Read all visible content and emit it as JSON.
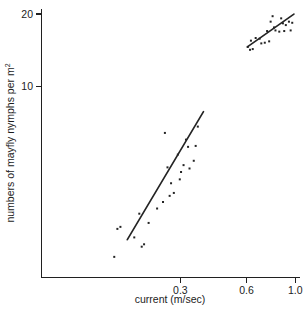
{
  "chart_data": {
    "type": "scatter",
    "title": "",
    "xlabel": "current (m/sec)",
    "ylabel": "numbers of mayfly nymphs per m²",
    "ylabel_base": "numbers of mayfly nymphs per m",
    "ylabel_exponent": "2",
    "x_scale": "log",
    "y_scale": "log",
    "grid": false,
    "legend": "none",
    "xticks": [
      "0.3",
      "0.6",
      "1.0"
    ],
    "xtick_values": [
      0.3,
      0.6,
      1.0
    ],
    "yticks": [
      "10",
      "20"
    ],
    "ytick_values": [
      10,
      20
    ],
    "xlim": [
      0.07,
      1.05
    ],
    "ylim": [
      1.6,
      21
    ],
    "series": [
      {
        "name": "low-current group",
        "points": [
          [
            0.15,
            1.95
          ],
          [
            0.155,
            2.55
          ],
          [
            0.16,
            2.6
          ],
          [
            0.185,
            2.35
          ],
          [
            0.195,
            2.95
          ],
          [
            0.2,
            2.15
          ],
          [
            0.205,
            2.2
          ],
          [
            0.215,
            2.7
          ],
          [
            0.235,
            3.1
          ],
          [
            0.25,
            3.3
          ],
          [
            0.255,
            6.4
          ],
          [
            0.262,
            4.6
          ],
          [
            0.268,
            3.5
          ],
          [
            0.272,
            3.95
          ],
          [
            0.28,
            3.6
          ],
          [
            0.292,
            5.2
          ],
          [
            0.298,
            4.1
          ],
          [
            0.302,
            4.4
          ],
          [
            0.31,
            4.7
          ],
          [
            0.318,
            6.0
          ],
          [
            0.325,
            5.6
          ],
          [
            0.33,
            4.55
          ],
          [
            0.345,
            4.9
          ],
          [
            0.352,
            5.65
          ],
          [
            0.36,
            6.8
          ]
        ],
        "fit_line": {
          "x_start": 0.172,
          "y_start": 2.3,
          "x_end": 0.382,
          "y_end": 7.85
        }
      },
      {
        "name": "high-current group",
        "points": [
          [
            0.608,
            14.6
          ],
          [
            0.622,
            14.2
          ],
          [
            0.628,
            15.5
          ],
          [
            0.64,
            14.3
          ],
          [
            0.66,
            15.9
          ],
          [
            0.688,
            15.8
          ],
          [
            0.7,
            15.1
          ],
          [
            0.726,
            15.2
          ],
          [
            0.744,
            17.0
          ],
          [
            0.76,
            15.4
          ],
          [
            0.772,
            18.6
          ],
          [
            0.788,
            19.6
          ],
          [
            0.8,
            17.6
          ],
          [
            0.812,
            17.1
          ],
          [
            0.845,
            16.9
          ],
          [
            0.862,
            19.2
          ],
          [
            0.878,
            18.3
          ],
          [
            0.89,
            17.0
          ],
          [
            0.905,
            18.0
          ],
          [
            0.935,
            18.6
          ],
          [
            0.952,
            17.1
          ],
          [
            0.968,
            18.4
          ]
        ],
        "fit_line": {
          "x_start": 0.605,
          "y_start": 14.6,
          "x_end": 0.985,
          "y_end": 20.0
        }
      }
    ]
  }
}
